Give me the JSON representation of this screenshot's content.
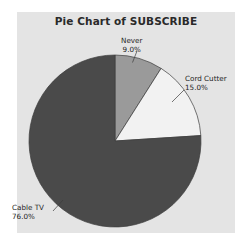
{
  "chart_data": {
    "type": "pie",
    "title": "Pie Chart of SUBSCRIBE",
    "xlabel": "",
    "ylabel": "",
    "legend": "none",
    "grid": false,
    "start_angle_deg": 90,
    "direction": "clockwise",
    "categories": [
      "Never",
      "Cord Cutter",
      "Cable TV"
    ],
    "values": [
      9.0,
      15.0,
      76.0
    ],
    "value_unit": "percent",
    "slices": [
      {
        "label": "Never",
        "percent_text": "9.0%",
        "value": 9.0,
        "color": "#9a9a9a"
      },
      {
        "label": "Cord Cutter",
        "percent_text": "15.0%",
        "value": 15.0,
        "color": "#f2f2f2"
      },
      {
        "label": "Cable TV",
        "percent_text": "76.0%",
        "value": 76.0,
        "color": "#4a4a4a"
      }
    ]
  },
  "figure": {
    "panel_color": "#e4e4e4",
    "page_color": "#ffffff",
    "outline_color": "#3c3c3c"
  }
}
